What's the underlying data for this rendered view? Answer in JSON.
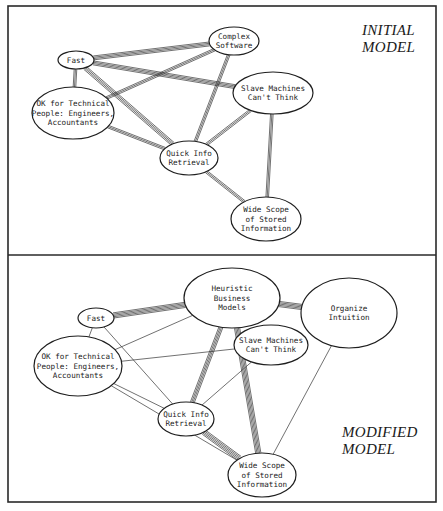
{
  "figure": {
    "panels": [
      {
        "id": "initial",
        "title_lines": [
          "INITIAL",
          "MODEL"
        ],
        "title_pos": [
          362,
          35
        ],
        "nodes": [
          {
            "id": "fast",
            "lines": [
              "Fast"
            ],
            "cx": 76,
            "cy": 60,
            "rx": 18,
            "ry": 9
          },
          {
            "id": "complex",
            "lines": [
              "Complex",
              "Software"
            ],
            "cx": 234,
            "cy": 41,
            "rx": 25,
            "ry": 14
          },
          {
            "id": "slave",
            "lines": [
              "Slave Machines",
              "Can't Think"
            ],
            "cx": 273,
            "cy": 93,
            "rx": 40,
            "ry": 21
          },
          {
            "id": "ok",
            "lines": [
              "OK for Technical",
              "People:  Engineers,",
              "Accountants"
            ],
            "cx": 73,
            "cy": 113,
            "rx": 41,
            "ry": 26
          },
          {
            "id": "quick",
            "lines": [
              "Quick Info",
              "Retrieval"
            ],
            "cx": 189,
            "cy": 158,
            "rx": 29,
            "ry": 17
          },
          {
            "id": "wide",
            "lines": [
              "Wide Scope",
              "of Stored",
              "Information"
            ],
            "cx": 266,
            "cy": 219,
            "rx": 35,
            "ry": 22
          }
        ],
        "edges": [
          {
            "from": "fast",
            "to": "complex",
            "strands": 4
          },
          {
            "from": "fast",
            "to": "slave",
            "strands": 4
          },
          {
            "from": "fast",
            "to": "ok",
            "strands": 3
          },
          {
            "from": "fast",
            "to": "quick",
            "strands": 4
          },
          {
            "from": "ok",
            "to": "complex",
            "strands": 3
          },
          {
            "from": "ok",
            "to": "quick",
            "strands": 3
          },
          {
            "from": "complex",
            "to": "quick",
            "strands": 3
          },
          {
            "from": "slave",
            "to": "quick",
            "strands": 3
          },
          {
            "from": "slave",
            "to": "wide",
            "strands": 3
          },
          {
            "from": "quick",
            "to": "wide",
            "strands": 3
          }
        ]
      },
      {
        "id": "modified",
        "title_lines": [
          "MODIFIED",
          "MODEL"
        ],
        "title_pos": [
          342,
          437
        ],
        "nodes": [
          {
            "id": "fast",
            "lines": [
              "Fast"
            ],
            "cx": 96,
            "cy": 318,
            "rx": 18,
            "ry": 10
          },
          {
            "id": "heuristic",
            "lines": [
              "Heuristic",
              "Business",
              "Models"
            ],
            "cx": 232,
            "cy": 298,
            "rx": 48,
            "ry": 30
          },
          {
            "id": "organize",
            "lines": [
              "Organize",
              "Intuition"
            ],
            "cx": 349,
            "cy": 313,
            "rx": 48,
            "ry": 35
          },
          {
            "id": "slave",
            "lines": [
              "Slave Machines",
              "Can't Think"
            ],
            "cx": 271,
            "cy": 345,
            "rx": 37,
            "ry": 20
          },
          {
            "id": "ok",
            "lines": [
              "OK for Technical",
              "People:  Engineers,",
              "Accountants"
            ],
            "cx": 78,
            "cy": 366,
            "rx": 44,
            "ry": 30
          },
          {
            "id": "quick",
            "lines": [
              "Quick Info",
              "Retrieval"
            ],
            "cx": 186,
            "cy": 419,
            "rx": 28,
            "ry": 17
          },
          {
            "id": "wide",
            "lines": [
              "Wide Scope",
              "of Stored",
              "Information"
            ],
            "cx": 262,
            "cy": 475,
            "rx": 34,
            "ry": 22
          }
        ],
        "edges": [
          {
            "from": "fast",
            "to": "heuristic",
            "strands": 5
          },
          {
            "from": "fast",
            "to": "ok",
            "strands": 1
          },
          {
            "from": "fast",
            "to": "quick",
            "strands": 1
          },
          {
            "from": "ok",
            "to": "heuristic",
            "strands": 1
          },
          {
            "from": "ok",
            "to": "slave",
            "strands": 1
          },
          {
            "from": "ok",
            "to": "quick",
            "strands": 1
          },
          {
            "from": "ok",
            "to": "wide",
            "strands": 1
          },
          {
            "from": "heuristic",
            "to": "organize",
            "strands": 5
          },
          {
            "from": "heuristic",
            "to": "quick",
            "strands": 4
          },
          {
            "from": "heuristic",
            "to": "wide",
            "strands": 5
          },
          {
            "from": "slave",
            "to": "quick",
            "strands": 1
          },
          {
            "from": "quick",
            "to": "wide",
            "strands": 5
          },
          {
            "from": "organize",
            "to": "wide",
            "strands": 1
          }
        ]
      }
    ],
    "frame": {
      "x": 8,
      "y": 6,
      "w": 428,
      "h": 496,
      "divider_y": 255
    }
  }
}
